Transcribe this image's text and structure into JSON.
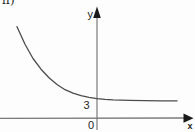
{
  "figure": {
    "item_label": "п)",
    "colors": {
      "background": "#fdfdfd",
      "axis": "#7a7a7a",
      "curve": "#4c4c4c",
      "arrow": "#1a1a1a",
      "text": "#1f1f1f"
    }
  },
  "graph": {
    "y_axis_label": "y",
    "x_axis_label": "x",
    "origin_label": "0",
    "asymptote_tick_label": "3"
  },
  "chart_data": {
    "type": "line",
    "title": "",
    "xlabel": "x",
    "ylabel": "y",
    "horizontal_asymptote_y": 3,
    "y_intercept_approx": 3.4,
    "x": [
      -5,
      -4.5,
      -4,
      -3.5,
      -3,
      -2.5,
      -2,
      -1.5,
      -1,
      -0.5,
      0,
      0.5,
      1,
      2,
      3,
      4,
      5
    ],
    "y": [
      16.1,
      13.0,
      10.5,
      8.6,
      7.1,
      5.9,
      5.0,
      4.4,
      3.95,
      3.65,
      3.4,
      3.28,
      3.2,
      3.1,
      3.06,
      3.03,
      3.02
    ],
    "axes": {
      "x_range": [
        -6,
        6
      ],
      "y_range": [
        0,
        18
      ],
      "grid": false
    },
    "legend": "none",
    "layout": {
      "origin_px": [
        97,
        118
      ],
      "px_per_x_unit": 16,
      "px_per_y_unit": 5.67
    }
  }
}
